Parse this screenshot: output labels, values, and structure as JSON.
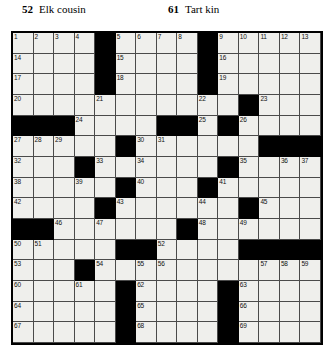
{
  "clues": {
    "across_top": [
      {
        "number": "52",
        "text": "Elk cousin"
      },
      {
        "number": "61",
        "text": "Tart kin"
      }
    ]
  },
  "grid": {
    "columns": 15,
    "rows": 15,
    "black_color": "#000000",
    "white_color": "#efefec",
    "border_color": "#000000",
    "pattern": [
      "..........#....#.....",
      "....#....#.....",
      "....#....#.....",
      "....#....#.....",
      "...............",
      "###...##.......",
      "...#..##....###",
      "...#.........##",
      "...#..#...#....",
      "....#....#.#...",
      "##...#...#.....",
      ".....##........",
      "...#...........",
      "...#..#....#...",
      ".....#....#....",
      ".....#....#...."
    ],
    "black_cells": [
      [
        1,
        5
      ],
      [
        1,
        10
      ],
      [
        2,
        5
      ],
      [
        2,
        10
      ],
      [
        3,
        5
      ],
      [
        3,
        10
      ],
      [
        4,
        12
      ],
      [
        5,
        1
      ],
      [
        5,
        2
      ],
      [
        5,
        3
      ],
      [
        5,
        8
      ],
      [
        5,
        9
      ],
      [
        5,
        11
      ],
      [
        6,
        6
      ],
      [
        6,
        13
      ],
      [
        6,
        14
      ],
      [
        6,
        15
      ],
      [
        7,
        4
      ],
      [
        7,
        11
      ],
      [
        8,
        6
      ],
      [
        8,
        10
      ],
      [
        9,
        5
      ],
      [
        9,
        12
      ],
      [
        10,
        1
      ],
      [
        10,
        2
      ],
      [
        10,
        9
      ],
      [
        11,
        6
      ],
      [
        11,
        7
      ],
      [
        11,
        12
      ],
      [
        11,
        13
      ],
      [
        11,
        14
      ],
      [
        11,
        15
      ],
      [
        12,
        4
      ],
      [
        13,
        6
      ],
      [
        13,
        11
      ],
      [
        14,
        6
      ],
      [
        14,
        11
      ],
      [
        15,
        6
      ],
      [
        15,
        11
      ]
    ],
    "numbers": [
      {
        "row": 1,
        "col": 1,
        "label": "1"
      },
      {
        "row": 1,
        "col": 2,
        "label": "2"
      },
      {
        "row": 1,
        "col": 3,
        "label": "3"
      },
      {
        "row": 1,
        "col": 4,
        "label": "4"
      },
      {
        "row": 1,
        "col": 6,
        "label": "5"
      },
      {
        "row": 1,
        "col": 7,
        "label": "6"
      },
      {
        "row": 1,
        "col": 8,
        "label": "7"
      },
      {
        "row": 1,
        "col": 9,
        "label": "8"
      },
      {
        "row": 1,
        "col": 11,
        "label": "9"
      },
      {
        "row": 1,
        "col": 12,
        "label": "10"
      },
      {
        "row": 1,
        "col": 13,
        "label": "11"
      },
      {
        "row": 1,
        "col": 14,
        "label": "12"
      },
      {
        "row": 1,
        "col": 15,
        "label": "13"
      },
      {
        "row": 2,
        "col": 1,
        "label": "14"
      },
      {
        "row": 2,
        "col": 6,
        "label": "15"
      },
      {
        "row": 2,
        "col": 11,
        "label": "16"
      },
      {
        "row": 3,
        "col": 1,
        "label": "17"
      },
      {
        "row": 3,
        "col": 6,
        "label": "18"
      },
      {
        "row": 3,
        "col": 11,
        "label": "19"
      },
      {
        "row": 4,
        "col": 1,
        "label": "20"
      },
      {
        "row": 4,
        "col": 5,
        "label": "21"
      },
      {
        "row": 4,
        "col": 10,
        "label": "22"
      },
      {
        "row": 4,
        "col": 13,
        "label": "23"
      },
      {
        "row": 5,
        "col": 4,
        "label": "24"
      },
      {
        "row": 5,
        "col": 10,
        "label": "25"
      },
      {
        "row": 5,
        "col": 12,
        "label": "26"
      },
      {
        "row": 6,
        "col": 1,
        "label": "27"
      },
      {
        "row": 6,
        "col": 2,
        "label": "28"
      },
      {
        "row": 6,
        "col": 3,
        "label": "29"
      },
      {
        "row": 6,
        "col": 7,
        "label": "30"
      },
      {
        "row": 6,
        "col": 8,
        "label": "31"
      },
      {
        "row": 7,
        "col": 1,
        "label": "32"
      },
      {
        "row": 7,
        "col": 5,
        "label": "33"
      },
      {
        "row": 7,
        "col": 7,
        "label": "34"
      },
      {
        "row": 7,
        "col": 12,
        "label": "35"
      },
      {
        "row": 7,
        "col": 14,
        "label": "36"
      },
      {
        "row": 7,
        "col": 15,
        "label": "37"
      },
      {
        "row": 8,
        "col": 1,
        "label": "38"
      },
      {
        "row": 8,
        "col": 4,
        "label": "39"
      },
      {
        "row": 8,
        "col": 7,
        "label": "40"
      },
      {
        "row": 8,
        "col": 11,
        "label": "41"
      },
      {
        "row": 9,
        "col": 1,
        "label": "42"
      },
      {
        "row": 9,
        "col": 6,
        "label": "43"
      },
      {
        "row": 9,
        "col": 10,
        "label": "44"
      },
      {
        "row": 9,
        "col": 13,
        "label": "45"
      },
      {
        "row": 10,
        "col": 3,
        "label": "46"
      },
      {
        "row": 10,
        "col": 5,
        "label": "47"
      },
      {
        "row": 10,
        "col": 10,
        "label": "48"
      },
      {
        "row": 10,
        "col": 12,
        "label": "49"
      },
      {
        "row": 11,
        "col": 1,
        "label": "50"
      },
      {
        "row": 11,
        "col": 2,
        "label": "51"
      },
      {
        "row": 11,
        "col": 8,
        "label": "52"
      },
      {
        "row": 12,
        "col": 1,
        "label": "53"
      },
      {
        "row": 12,
        "col": 5,
        "label": "54"
      },
      {
        "row": 12,
        "col": 7,
        "label": "55"
      },
      {
        "row": 12,
        "col": 8,
        "label": "56"
      },
      {
        "row": 12,
        "col": 13,
        "label": "57"
      },
      {
        "row": 12,
        "col": 14,
        "label": "58"
      },
      {
        "row": 12,
        "col": 15,
        "label": "59"
      },
      {
        "row": 13,
        "col": 1,
        "label": "60"
      },
      {
        "row": 13,
        "col": 4,
        "label": "61"
      },
      {
        "row": 13,
        "col": 7,
        "label": "62"
      },
      {
        "row": 13,
        "col": 12,
        "label": "63"
      },
      {
        "row": 14,
        "col": 1,
        "label": "64"
      },
      {
        "row": 14,
        "col": 7,
        "label": "65"
      },
      {
        "row": 14,
        "col": 12,
        "label": "66"
      },
      {
        "row": 15,
        "col": 1,
        "label": "67"
      },
      {
        "row": 15,
        "col": 7,
        "label": "68"
      },
      {
        "row": 15,
        "col": 12,
        "label": "69"
      }
    ]
  }
}
